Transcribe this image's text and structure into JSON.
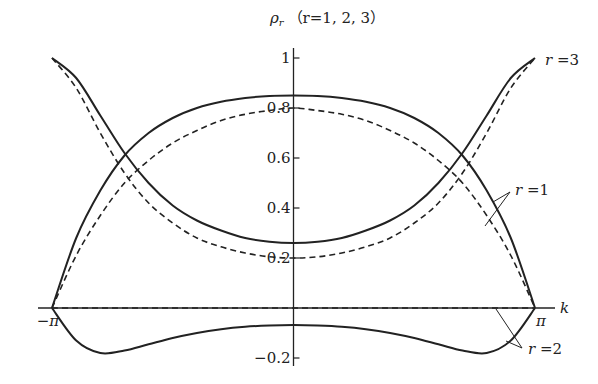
{
  "chart_data": {
    "type": "line",
    "title": "",
    "ylabel": "ρ_r (r=1, 2, 3)",
    "ylabel_prefix": "ρ",
    "ylabel_sub": "r",
    "ylabel_suffix": "（r=1, 2, 3）",
    "xlabel": "k",
    "xlim": [
      -3.14159,
      3.14159
    ],
    "ylim": [
      -0.25,
      1.05
    ],
    "x_ticks": [
      {
        "value": -3.14159,
        "label": "−π"
      },
      {
        "value": 3.14159,
        "label": "π"
      }
    ],
    "y_ticks": [
      {
        "value": 1,
        "label": "1"
      },
      {
        "value": 0.8,
        "label": "0.8"
      },
      {
        "value": 0.6,
        "label": "0.6"
      },
      {
        "value": 0.4,
        "label": "0.4"
      },
      {
        "value": 0.2,
        "label": "0.2"
      },
      {
        "value": -0.2,
        "label": "−0.2"
      }
    ],
    "grid": false,
    "legend": "annotations",
    "annotations": [
      {
        "text": "r=3",
        "x": 3.14159,
        "y": 1.0
      },
      {
        "text": "r=1",
        "x": 2.7,
        "y": 0.43
      },
      {
        "text": "r=2",
        "x": 2.9,
        "y": -0.15
      }
    ],
    "x": [
      -3.14159,
      -2.827,
      -2.513,
      -2.199,
      -1.885,
      -1.571,
      -1.257,
      -0.942,
      -0.628,
      -0.314,
      0,
      0.314,
      0.628,
      0.942,
      1.257,
      1.571,
      1.885,
      2.199,
      2.513,
      2.827,
      3.14159
    ],
    "series": [
      {
        "name": "r=1 (solid)",
        "style": "solid",
        "values": [
          0.0,
          0.28,
          0.47,
          0.61,
          0.7,
          0.76,
          0.8,
          0.825,
          0.84,
          0.848,
          0.85,
          0.848,
          0.84,
          0.825,
          0.8,
          0.76,
          0.7,
          0.61,
          0.47,
          0.28,
          0.0
        ]
      },
      {
        "name": "r=1 (dashed)",
        "style": "dashed",
        "values": [
          0.0,
          0.21,
          0.37,
          0.5,
          0.59,
          0.66,
          0.71,
          0.75,
          0.775,
          0.79,
          0.8,
          0.79,
          0.775,
          0.75,
          0.71,
          0.66,
          0.59,
          0.5,
          0.37,
          0.21,
          0.0
        ]
      },
      {
        "name": "r=2 (solid)",
        "style": "solid",
        "values": [
          0.0,
          -0.13,
          -0.18,
          -0.17,
          -0.145,
          -0.12,
          -0.1,
          -0.085,
          -0.075,
          -0.07,
          -0.068,
          -0.07,
          -0.075,
          -0.085,
          -0.1,
          -0.12,
          -0.145,
          -0.17,
          -0.18,
          -0.13,
          0.0
        ]
      },
      {
        "name": "r=2 (dashed)",
        "style": "dashed",
        "values": [
          0,
          0,
          0,
          0,
          0,
          0,
          0,
          0,
          0,
          0,
          0,
          0,
          0,
          0,
          0,
          0,
          0,
          0,
          0,
          0,
          0
        ]
      },
      {
        "name": "r=3 (solid)",
        "style": "solid",
        "values": [
          1.0,
          0.92,
          0.77,
          0.62,
          0.5,
          0.41,
          0.35,
          0.31,
          0.28,
          0.265,
          0.26,
          0.265,
          0.28,
          0.31,
          0.35,
          0.41,
          0.5,
          0.62,
          0.77,
          0.92,
          1.0
        ]
      },
      {
        "name": "r=3 (dashed)",
        "style": "dashed",
        "values": [
          1.0,
          0.88,
          0.7,
          0.54,
          0.42,
          0.34,
          0.28,
          0.245,
          0.22,
          0.205,
          0.2,
          0.205,
          0.22,
          0.245,
          0.28,
          0.34,
          0.42,
          0.54,
          0.7,
          0.88,
          1.0
        ]
      }
    ]
  },
  "colors": {
    "ink": "#222222",
    "background": "#ffffff"
  }
}
